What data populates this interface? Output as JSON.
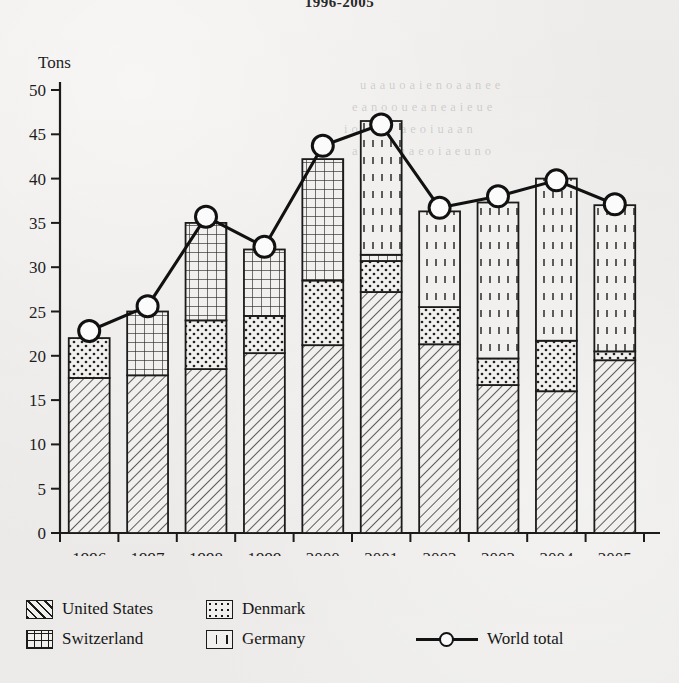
{
  "title": "1996-2005",
  "axes": {
    "y_label": "Tons",
    "x_label": "Year",
    "y_ticks": [
      0,
      5,
      10,
      15,
      20,
      25,
      30,
      35,
      40,
      45,
      50
    ],
    "y_min": 0,
    "y_max": 50
  },
  "legend": {
    "items": [
      {
        "key": "united_states",
        "label": "United States",
        "pattern": "diagonal-hatch"
      },
      {
        "key": "denmark",
        "label": "Denmark",
        "pattern": "dots"
      },
      {
        "key": "switzerland",
        "label": "Switzerland",
        "pattern": "grid"
      },
      {
        "key": "germany",
        "label": "Germany",
        "pattern": "dashed-vertical"
      },
      {
        "key": "world_total",
        "label": "World total",
        "pattern": "line-circle-marker"
      }
    ]
  },
  "colors": {
    "ink": "#1b1b1b",
    "fill": "#f2f0ee",
    "paper": "#eceae8",
    "marker_fill": "#fafafa"
  },
  "chart_data": {
    "type": "bar",
    "title": "1996-2005",
    "xlabel": "Year",
    "ylabel": "Tons",
    "ylim": [
      0,
      50
    ],
    "grid": false,
    "legend_position": "bottom",
    "stacked": true,
    "categories": [
      "1996",
      "1997",
      "1998",
      "1999",
      "2000",
      "2001",
      "2002",
      "2003",
      "2004",
      "2005"
    ],
    "series": [
      {
        "name": "United States",
        "values": [
          17.5,
          17.8,
          18.5,
          20.3,
          21.2,
          27.2,
          21.3,
          16.7,
          16.0,
          19.5
        ]
      },
      {
        "name": "Denmark",
        "values": [
          4.5,
          0.0,
          5.5,
          4.2,
          7.3,
          3.5,
          4.2,
          3.0,
          5.7,
          1.0
        ]
      },
      {
        "name": "Switzerland",
        "values": [
          0.0,
          7.2,
          11.0,
          7.5,
          13.7,
          0.7,
          0.0,
          0.0,
          0.0,
          0.0
        ]
      },
      {
        "name": "Germany",
        "values": [
          0.0,
          0.0,
          0.0,
          0.0,
          0.0,
          15.1,
          10.8,
          17.6,
          18.3,
          16.5
        ]
      }
    ],
    "overlay_line": {
      "name": "World total",
      "values": [
        22.8,
        25.6,
        35.7,
        32.3,
        43.7,
        46.1,
        36.7,
        38.0,
        39.8,
        37.1
      ]
    },
    "bar_totals": [
      22.0,
      25.0,
      35.0,
      32.0,
      42.2,
      46.5,
      36.3,
      37.3,
      40.0,
      37.0
    ]
  }
}
